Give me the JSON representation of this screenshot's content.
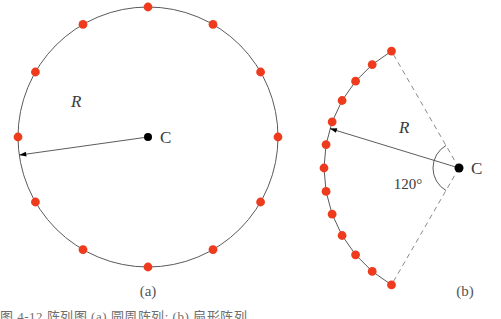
{
  "figure": {
    "background_color": "#ffffff",
    "dot_color": "#ee3b1e",
    "curve_color": "#5a5a5a",
    "dashed_color": "#8a8a8a",
    "center_dot_color": "#000000",
    "panels": [
      {
        "id": "a",
        "caption": "(a)",
        "caption_x": 148,
        "caption_y": 296,
        "type": "full-circle",
        "center": {
          "x": 148,
          "y": 137
        },
        "radius": 130,
        "dot_count": 12,
        "dot_radius": 4.4,
        "start_angle_deg": -90,
        "sweep_deg": 360,
        "center_label": "C",
        "center_label_x": 160,
        "center_label_y": 143,
        "center_dot_radius": 4,
        "radius_label": "R",
        "radius_label_x": 71,
        "radius_label_y": 107,
        "radius_arrow_angle_deg": 172,
        "arrow_head_size": 7
      },
      {
        "id": "b",
        "caption": "(b)",
        "caption_x": 465,
        "caption_y": 296,
        "type": "arc-sector",
        "center": {
          "x": 459,
          "y": 168
        },
        "radius": 135,
        "dot_count": 13,
        "dot_radius": 4.4,
        "start_angle_deg": 120,
        "sweep_deg": 120,
        "center_label": "C",
        "center_label_x": 471,
        "center_label_y": 174,
        "center_dot_radius": 4.5,
        "radius_label": "R",
        "radius_label_x": 399,
        "radius_label_y": 133,
        "radius_arrow_angle_deg": 197,
        "arrow_head_size": 7,
        "angle_label": "120°",
        "angle_label_x": 408,
        "angle_label_y": 189,
        "angle_marker_radius": 26,
        "dashed_edges": true
      }
    ]
  },
  "bottom_text": {
    "visible_fragment": "图 4-12    阵列图         (a) 圆周阵列;  (b) 扇形阵列"
  }
}
